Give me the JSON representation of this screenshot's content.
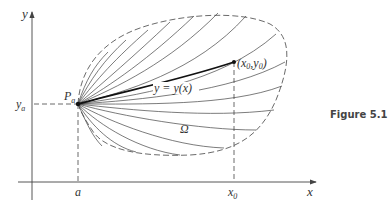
{
  "figure": {
    "caption": "Figure 5.1",
    "labels": {
      "y_axis": "y",
      "x_axis": "x",
      "y_a": "y",
      "y_a_sub": "a",
      "a": "a",
      "x_0": "x",
      "x_0_sub": "0",
      "P_a": "P",
      "P_a_sub": "a",
      "endpoint": "(x",
      "endpoint_sub1": "0",
      "endpoint_mid": ",y",
      "endpoint_sub2": "0",
      "endpoint_close": ")",
      "curve": "y = y(x)",
      "region": "Ω"
    },
    "colors": {
      "stroke": "#333333",
      "highlight_curve": "#111111",
      "background": "#ffffff"
    }
  }
}
